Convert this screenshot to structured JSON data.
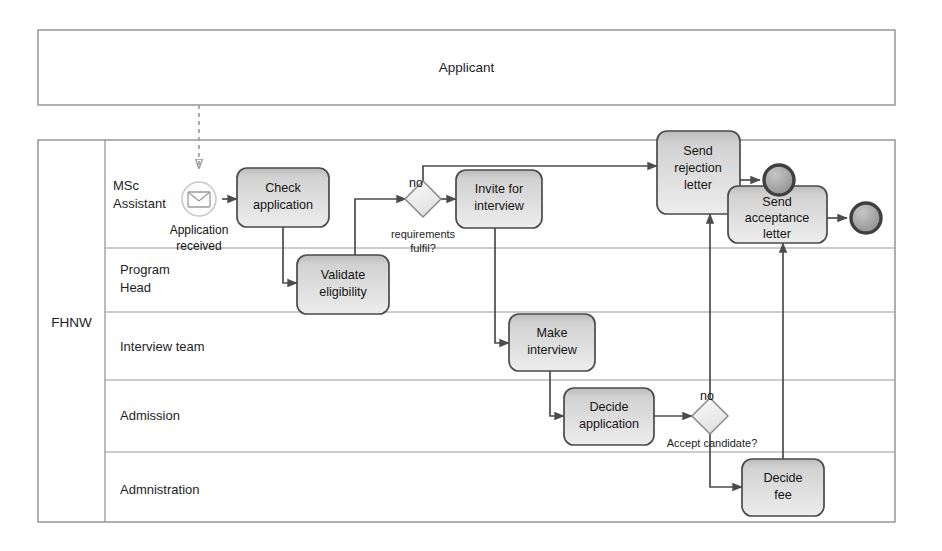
{
  "diagram": {
    "title": "Applicant",
    "pools": [
      {
        "id": "applicant",
        "label": "Applicant"
      },
      {
        "id": "fhnw",
        "label": "FHNW"
      }
    ],
    "lanes": [
      {
        "id": "msc-assistant",
        "label_line1": "MSc",
        "label_line2": "Assistant"
      },
      {
        "id": "program-head",
        "label_line1": "Program",
        "label_line2": "Head"
      },
      {
        "id": "interview-team",
        "label_line1": "Interview team",
        "label_line2": ""
      },
      {
        "id": "admission",
        "label_line1": "Admission",
        "label_line2": ""
      },
      {
        "id": "administration",
        "label_line1": "Admnistration",
        "label_line2": ""
      }
    ],
    "events": [
      {
        "id": "start-message",
        "type": "message-start",
        "label_line1": "Application",
        "label_line2": "received"
      },
      {
        "id": "end-rejection",
        "type": "end",
        "label": ""
      },
      {
        "id": "end-acceptance",
        "type": "end",
        "label": ""
      }
    ],
    "tasks": [
      {
        "id": "check-application",
        "line1": "Check",
        "line2": "application",
        "line3": ""
      },
      {
        "id": "validate-eligibility",
        "line1": "Validate",
        "line2": "eligibility",
        "line3": ""
      },
      {
        "id": "invite-for-interview",
        "line1": "Invite for",
        "line2": "interview",
        "line3": ""
      },
      {
        "id": "make-interview",
        "line1": "Make",
        "line2": "interview",
        "line3": ""
      },
      {
        "id": "decide-application",
        "line1": "Decide",
        "line2": "application",
        "line3": ""
      },
      {
        "id": "decide-fee",
        "line1": "Decide",
        "line2": "fee",
        "line3": ""
      },
      {
        "id": "send-rejection-letter",
        "line1": "Send",
        "line2": "rejection",
        "line3": "letter"
      },
      {
        "id": "send-acceptance-letter",
        "line1": "Send",
        "line2": "acceptance",
        "line3": "letter"
      }
    ],
    "gateways": [
      {
        "id": "requirements-fulfil",
        "label_line1": "requirements",
        "label_line2": "fulfil?"
      },
      {
        "id": "accept-candidate",
        "label_line1": "Accept candidate?",
        "label_line2": ""
      }
    ],
    "flow_labels": [
      {
        "id": "no-requirements",
        "text": "no"
      },
      {
        "id": "no-accept",
        "text": "no"
      }
    ],
    "colors": {
      "task_fill_top": "#c9c9c9",
      "task_fill_bottom": "#ebebeb",
      "task_border": "#4a4a4a",
      "gateway_fill": "#f2f2f2",
      "end_event_fill": "#a8a8a8",
      "pool_border": "#8f8f8f",
      "connector": "#4c4c4c",
      "text": "#151515"
    }
  }
}
